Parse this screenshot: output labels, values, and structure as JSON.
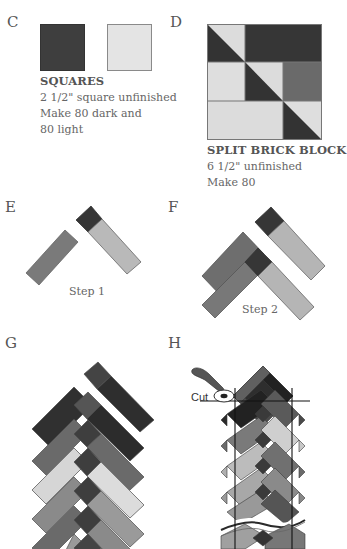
{
  "colors": {
    "dark": "#3a3a3a",
    "darkest": "#2a2a2a",
    "medium_dark": "#5e5e5e",
    "medium": "#7a7a7a",
    "light_medium": "#a4a4a4",
    "light": "#dcdcdc",
    "outline": "#6a6a6a"
  },
  "sections": {
    "c": {
      "label": "C",
      "title": "SQUARES",
      "lines": [
        "2 1/2\" square unfinished",
        "Make 80 dark and",
        "80 light"
      ],
      "swatches": [
        "dark",
        "light"
      ]
    },
    "d": {
      "label": "D",
      "title": "SPLIT BRICK BLOCK",
      "lines": [
        " 6 1/2\" unfinished",
        "Make 80"
      ]
    },
    "e": {
      "label": "E",
      "caption": "Step 1"
    },
    "f": {
      "label": "F",
      "caption": "Step 2"
    },
    "g": {
      "label": "G"
    },
    "h": {
      "label": "H",
      "cut_label": "Cut"
    }
  }
}
